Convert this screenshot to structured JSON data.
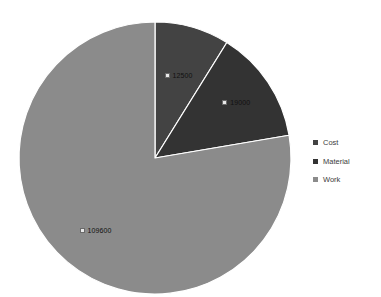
{
  "chart_data": {
    "type": "pie",
    "title": "",
    "categories": [
      "Cost",
      "Material",
      "Work"
    ],
    "values": [
      12500,
      19000,
      109600
    ],
    "labels": [
      "12500",
      "19000",
      "109600"
    ],
    "total": 141100,
    "legend_position": "right",
    "grid": false,
    "colors": [
      "#434343",
      "#333333",
      "#8b8b8b"
    ],
    "start_angle_deg": 0,
    "direction": "clockwise"
  },
  "legend": {
    "items": [
      {
        "label": "Cost",
        "color": "#434343"
      },
      {
        "label": "Material",
        "color": "#333333"
      },
      {
        "label": "Work",
        "color": "#8b8b8b"
      }
    ]
  },
  "slices": [
    {
      "name": "Cost",
      "label": "12500",
      "color": "#434343"
    },
    {
      "name": "Material",
      "label": "19000",
      "color": "#333333"
    },
    {
      "name": "Work",
      "label": "109600",
      "color": "#8b8b8b"
    }
  ],
  "geometry": {
    "center_x": 155,
    "center_y": 158,
    "radius": 136
  }
}
